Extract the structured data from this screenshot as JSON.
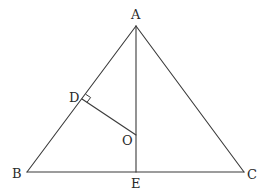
{
  "diagram": {
    "type": "geometry",
    "points": {
      "A": {
        "label": "A",
        "x": 136,
        "y": 26
      },
      "B": {
        "label": "B",
        "x": 27,
        "y": 172
      },
      "C": {
        "label": "C",
        "x": 244,
        "y": 172
      },
      "D": {
        "label": "D",
        "x": 82,
        "y": 99
      },
      "O": {
        "label": "O",
        "x": 136,
        "y": 135
      },
      "E": {
        "label": "E",
        "x": 136,
        "y": 172
      }
    },
    "segments": [
      {
        "from": "A",
        "to": "B"
      },
      {
        "from": "A",
        "to": "C"
      },
      {
        "from": "B",
        "to": "C"
      },
      {
        "from": "A",
        "to": "E"
      },
      {
        "from": "D",
        "to": "O"
      }
    ],
    "right_angle_markers": [
      {
        "at": "D",
        "between": [
          "A",
          "O"
        ]
      }
    ],
    "line_color": "#3a3a3a",
    "label_color": "#2a2a2a"
  }
}
